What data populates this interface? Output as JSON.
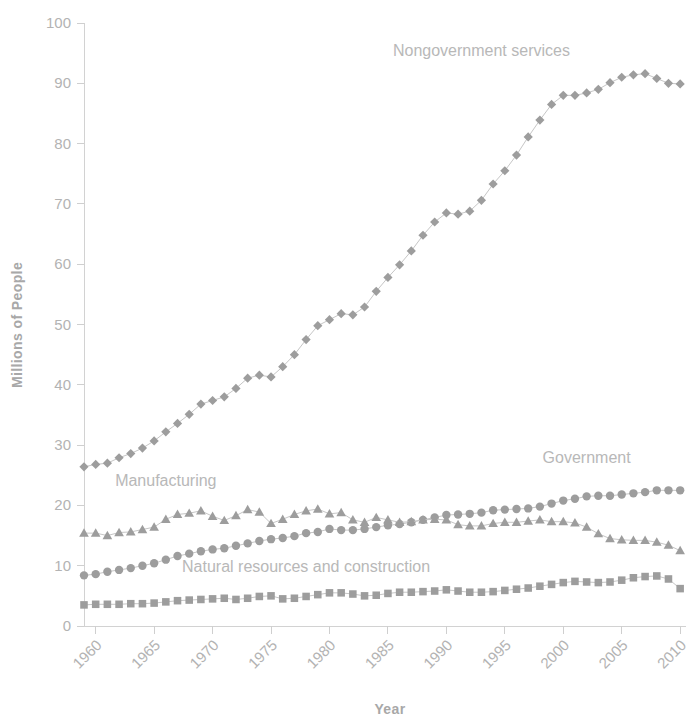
{
  "chart_data": {
    "type": "scatter",
    "title": "",
    "xlabel": "Year",
    "ylabel": "Millions of People",
    "xlim": [
      1959,
      2010.5
    ],
    "ylim": [
      0,
      100
    ],
    "xticks": [
      1960,
      1965,
      1970,
      1975,
      1980,
      1985,
      1990,
      1995,
      2000,
      2005,
      2010
    ],
    "yticks": [
      0,
      10,
      20,
      30,
      40,
      50,
      60,
      70,
      80,
      90,
      100
    ],
    "xtick_labels": [
      "1960",
      "1965",
      "1970",
      "1975",
      "1980",
      "1985",
      "1990",
      "1995",
      "2000",
      "2005",
      "2010"
    ],
    "ytick_labels": [
      "0",
      "10",
      "20",
      "30",
      "40",
      "50",
      "60",
      "70",
      "80",
      "90",
      "100"
    ],
    "grid": false,
    "legend_position": "inline-annotations",
    "marker_color": "#9d9d9d",
    "text_color": "#b3b3b3",
    "axis_color": "#d2d2d2",
    "x": [
      1959,
      1960,
      1961,
      1962,
      1963,
      1964,
      1965,
      1966,
      1967,
      1968,
      1969,
      1970,
      1971,
      1972,
      1973,
      1974,
      1975,
      1976,
      1977,
      1978,
      1979,
      1980,
      1981,
      1982,
      1983,
      1984,
      1985,
      1986,
      1987,
      1988,
      1989,
      1990,
      1991,
      1992,
      1993,
      1994,
      1995,
      1996,
      1997,
      1998,
      1999,
      2000,
      2001,
      2002,
      2003,
      2004,
      2005,
      2006,
      2007,
      2008,
      2009,
      2010
    ],
    "series": [
      {
        "name": "Nongovernment services",
        "marker": "diamond",
        "label_x": 1993,
        "label_y": 94.5,
        "values": [
          26.4,
          26.8,
          27.0,
          27.9,
          28.6,
          29.5,
          30.7,
          32.2,
          33.6,
          35.1,
          36.8,
          37.4,
          38.0,
          39.4,
          41.1,
          41.6,
          41.3,
          43.0,
          45.0,
          47.5,
          49.8,
          50.8,
          51.8,
          51.6,
          52.9,
          55.5,
          57.8,
          59.9,
          62.2,
          64.8,
          67.0,
          68.5,
          68.3,
          68.8,
          70.6,
          73.3,
          75.5,
          78.1,
          81.1,
          83.9,
          86.5,
          88.0,
          88.0,
          88.4,
          89.0,
          90.1,
          91.0,
          91.4,
          91.6,
          90.8,
          90.0,
          89.9
        ]
      },
      {
        "name": "Government",
        "marker": "circle",
        "label_x": 2002,
        "label_y": 27.0,
        "values": [
          8.4,
          8.6,
          9.0,
          9.3,
          9.6,
          10.0,
          10.4,
          11.0,
          11.6,
          12.0,
          12.4,
          12.7,
          12.9,
          13.3,
          13.7,
          14.1,
          14.4,
          14.6,
          14.9,
          15.4,
          15.6,
          16.1,
          15.9,
          15.9,
          16.1,
          16.4,
          16.7,
          16.9,
          17.2,
          17.6,
          18.0,
          18.4,
          18.5,
          18.6,
          18.8,
          19.2,
          19.3,
          19.4,
          19.5,
          19.8,
          20.3,
          20.8,
          21.1,
          21.5,
          21.6,
          21.6,
          21.8,
          22.0,
          22.2,
          22.5,
          22.5,
          22.5
        ]
      },
      {
        "name": "Manufacturing",
        "marker": "triangle",
        "label_x": 1966,
        "label_y": 23.2,
        "values": [
          15.4,
          15.4,
          15.0,
          15.5,
          15.6,
          16.0,
          16.4,
          17.7,
          18.5,
          18.7,
          19.1,
          18.2,
          17.5,
          18.3,
          19.3,
          18.9,
          17.0,
          17.7,
          18.5,
          19.1,
          19.4,
          18.6,
          18.8,
          17.6,
          17.2,
          18.0,
          17.6,
          17.2,
          17.3,
          17.6,
          17.7,
          17.6,
          16.8,
          16.6,
          16.6,
          17.0,
          17.2,
          17.2,
          17.4,
          17.6,
          17.3,
          17.3,
          17.1,
          16.4,
          15.3,
          14.5,
          14.3,
          14.2,
          14.2,
          13.9,
          13.4,
          12.5
        ]
      },
      {
        "name": "Natural resources and construction",
        "marker": "square",
        "label_x": 1978,
        "label_y": 9.0,
        "values": [
          3.5,
          3.6,
          3.6,
          3.6,
          3.7,
          3.7,
          3.8,
          4.0,
          4.2,
          4.3,
          4.4,
          4.5,
          4.6,
          4.4,
          4.6,
          4.9,
          5.0,
          4.5,
          4.6,
          4.9,
          5.2,
          5.5,
          5.5,
          5.3,
          5.0,
          5.1,
          5.4,
          5.6,
          5.6,
          5.7,
          5.8,
          6.0,
          5.8,
          5.6,
          5.6,
          5.7,
          5.9,
          6.1,
          6.3,
          6.6,
          6.9,
          7.2,
          7.4,
          7.3,
          7.2,
          7.3,
          7.6,
          8.0,
          8.2,
          8.3,
          7.8,
          6.2
        ]
      }
    ]
  },
  "axes": {
    "x_title": "Year",
    "y_title": "Millions of People"
  },
  "annotations": {
    "nongovernment_services": "Nongovernment services",
    "government": "Government",
    "manufacturing": "Manufacturing",
    "natural_resources": "Natural resources and construction"
  }
}
